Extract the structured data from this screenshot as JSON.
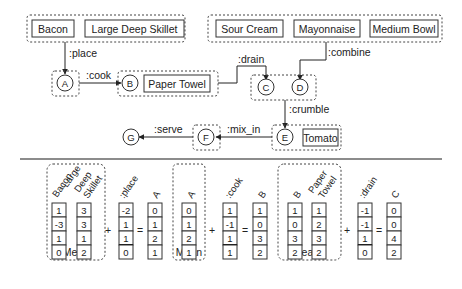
{
  "top_graph": {
    "groups": [
      {
        "id": "g_inputs1",
        "items": [
          "Bacon",
          "Large Deep Skillet"
        ]
      },
      {
        "id": "g_inputs2",
        "items": [
          "Sour Cream",
          "Mayonnaise",
          "Medium Bowl"
        ]
      }
    ],
    "nodes": {
      "A": "A",
      "B": "B",
      "C": "C",
      "D": "D",
      "E": "E",
      "F": "F",
      "G": "G"
    },
    "node_ingredients": {
      "B": "Paper Towel",
      "E": "Tomato"
    },
    "edges": [
      {
        "from": "g_inputs1",
        "to": "A",
        "label": ":place"
      },
      {
        "from": "A",
        "to": "B",
        "label": ":cook"
      },
      {
        "from": "B",
        "to": "C",
        "label": ":drain"
      },
      {
        "from": "g_inputs2",
        "to": "D",
        "label": ":combine"
      },
      {
        "from": "CD",
        "to": "E",
        "label": ":crumble"
      },
      {
        "from": "E",
        "to": "F",
        "label": ":mix_in"
      },
      {
        "from": "F",
        "to": "G",
        "label": ":serve"
      }
    ]
  },
  "bottom_equations": {
    "mean_label": "Mean",
    "plus": "+",
    "equals": "=",
    "eq1": {
      "inputs": [
        {
          "header": "Bacon",
          "values": [
            "1",
            "-3",
            "1",
            "0"
          ]
        },
        {
          "header": "Large Deep Skillet",
          "header_lines": [
            "Large",
            "Deep",
            "Skillet"
          ],
          "values": [
            "3",
            "3",
            "1",
            "2"
          ]
        }
      ],
      "relation": {
        "header": ":place",
        "values": [
          "-2",
          "1",
          "1",
          "0"
        ]
      },
      "result": {
        "header": "A",
        "values": [
          "0",
          "1",
          "2",
          "1"
        ]
      }
    },
    "eq2": {
      "inputs": [
        {
          "header": "A",
          "values": [
            "0",
            "1",
            "2",
            "1"
          ]
        }
      ],
      "relation": {
        "header": ":cook",
        "values": [
          "1",
          "-1",
          "1",
          "1"
        ]
      },
      "result": {
        "header": "B",
        "values": [
          "1",
          "0",
          "3",
          "2"
        ]
      }
    },
    "eq3": {
      "inputs": [
        {
          "header": "B",
          "values": [
            "1",
            "0",
            "3",
            "2"
          ]
        },
        {
          "header": "Paper Towel",
          "header_lines": [
            "Paper",
            "Towel"
          ],
          "values": [
            "1",
            "2",
            "3",
            "2"
          ]
        }
      ],
      "relation": {
        "header": ":drain",
        "values": [
          "-1",
          "-1",
          "1",
          "0"
        ]
      },
      "result": {
        "header": "C",
        "values": [
          "0",
          "0",
          "4",
          "2"
        ]
      }
    }
  }
}
